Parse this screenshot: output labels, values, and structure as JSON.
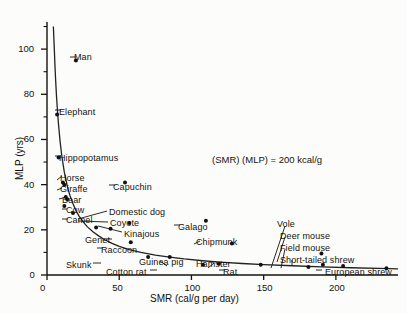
{
  "chart_data": {
    "type": "scatter",
    "title": "",
    "xlabel": "SMR (cal/g per day)",
    "ylabel": "MLP (yrs)",
    "xlim": [
      0,
      243
    ],
    "ylim": [
      0,
      112
    ],
    "xticks": [
      0,
      50,
      100,
      150,
      200
    ],
    "yticks": [
      0,
      20,
      40,
      60,
      80,
      100
    ],
    "y_minor_ticks": [
      10,
      30,
      50,
      70,
      90,
      110
    ],
    "grid": false,
    "legend": "none",
    "annotation": "(SMR)  (MLP) = 200 kcal/g",
    "curve": {
      "equation": "SMR x MLP = 200 kcal/g",
      "label": "hyperbola",
      "points": [
        [
          4.4,
          110
        ],
        [
          5,
          101
        ],
        [
          5.5,
          93
        ],
        [
          6,
          86
        ],
        [
          6.5,
          80
        ],
        [
          7,
          75
        ],
        [
          7.5,
          70.5
        ],
        [
          8,
          66.5
        ],
        [
          9,
          59.5
        ],
        [
          10,
          54
        ],
        [
          11,
          49.5
        ],
        [
          12,
          45.5
        ],
        [
          13,
          42.5
        ],
        [
          14,
          39.5
        ],
        [
          15,
          37
        ],
        [
          16,
          35
        ],
        [
          18,
          31.5
        ],
        [
          20,
          28.5
        ],
        [
          22,
          26.3
        ],
        [
          25,
          23.5
        ],
        [
          28,
          21.3
        ],
        [
          32,
          19
        ],
        [
          36,
          17.2
        ],
        [
          40,
          15.6
        ],
        [
          45,
          14
        ],
        [
          50,
          12.7
        ],
        [
          57,
          11.2
        ],
        [
          65,
          10
        ],
        [
          75,
          8.8
        ],
        [
          85,
          7.9
        ],
        [
          95,
          7.1
        ],
        [
          108,
          6.3
        ],
        [
          120,
          5.7
        ],
        [
          135,
          5.1
        ],
        [
          150,
          4.6
        ],
        [
          170,
          4.1
        ],
        [
          190,
          3.6
        ],
        [
          210,
          3.2
        ],
        [
          230,
          2.9
        ],
        [
          243,
          2.7
        ]
      ]
    },
    "points": [
      {
        "name": "Man",
        "smr": 20,
        "mlp": 95,
        "label_pos": "right"
      },
      {
        "name": "Elephant",
        "smr": 7,
        "mlp": 71,
        "label_pos": "right"
      },
      {
        "name": "Hippopotamus",
        "smr": 8,
        "mlp": 52,
        "label_pos": "right"
      },
      {
        "name": "Horse",
        "smr": 11,
        "mlp": 41,
        "label_pos": "upper-right"
      },
      {
        "name": "Giraffe",
        "smr": 12,
        "mlp": 40,
        "label_pos": "right"
      },
      {
        "name": "Bear",
        "smr": 13,
        "mlp": 34.5,
        "label_pos": "right"
      },
      {
        "name": "Cow",
        "smr": 14,
        "mlp": 33.5,
        "label_pos": "right"
      },
      {
        "name": "Camel",
        "smr": 12,
        "mlp": 30.5,
        "label_pos": "right"
      },
      {
        "name": "Capuchin",
        "smr": 54,
        "mlp": 41,
        "label_pos": "right"
      },
      {
        "name": "Domestic dog",
        "smr": 18,
        "mlp": 27.5,
        "label_pos": "far-right"
      },
      {
        "name": "Coyote",
        "smr": 34,
        "mlp": 21,
        "label_pos": "upper-right"
      },
      {
        "name": "Kinajous",
        "smr": 57,
        "mlp": 23,
        "label_pos": "right"
      },
      {
        "name": "Genet",
        "smr": 44,
        "mlp": 20.5,
        "label_pos": "right"
      },
      {
        "name": "Galago",
        "smr": 110,
        "mlp": 24,
        "label_pos": "right"
      },
      {
        "name": "Raccoon",
        "smr": 58,
        "mlp": 14.5,
        "label_pos": "right"
      },
      {
        "name": "Chipmunk",
        "smr": 128,
        "mlp": 14,
        "label_pos": "upper-right"
      },
      {
        "name": "Skunk",
        "smr": 70,
        "mlp": 8,
        "label_pos": "left"
      },
      {
        "name": "Guinea pig",
        "smr": 85,
        "mlp": 8,
        "label_pos": "upper-right"
      },
      {
        "name": "Cotton rat",
        "smr": 108,
        "mlp": 4.5,
        "label_pos": "left"
      },
      {
        "name": "Hamster",
        "smr": 119,
        "mlp": 5,
        "label_pos": "upper-right"
      },
      {
        "name": "Rat",
        "smr": 148,
        "mlp": 4.5,
        "label_pos": "right"
      },
      {
        "name": "Vole",
        "smr": 181,
        "mlp": 3.5,
        "label_pos": "leader-up"
      },
      {
        "name": "Deer mouse",
        "smr": 190,
        "mlp": 9.5,
        "label_pos": "leader-up"
      },
      {
        "name": "Field mouse",
        "smr": 191,
        "mlp": 4.5,
        "label_pos": "leader-up"
      },
      {
        "name": "Short-tailed shrew",
        "smr": 205,
        "mlp": 4,
        "label_pos": "leader-up"
      },
      {
        "name": "European shrew",
        "smr": 235,
        "mlp": 3,
        "label_pos": "right"
      }
    ]
  },
  "axes": {
    "x_title": "SMR (cal/g per day)",
    "y_title": "MLP (yrs)",
    "x_tick_labels": [
      "0",
      "50",
      "100",
      "150",
      "200"
    ],
    "y_tick_labels": [
      "0",
      "20",
      "40",
      "60",
      "80",
      "100"
    ]
  },
  "annotation": {
    "text": "(SMR)  (MLP) = 200 kcal/g"
  },
  "colors": {
    "ink": "#15130f",
    "background": "#fcfcfa",
    "point": "#111111",
    "curve": "#222222"
  }
}
